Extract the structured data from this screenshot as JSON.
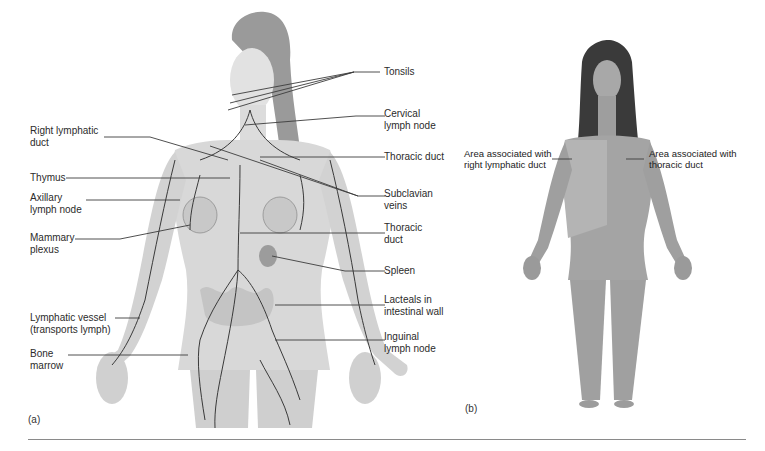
{
  "figure": {
    "panel_a": {
      "tag": "(a)",
      "labels_left": [
        {
          "id": "right-lymphatic-duct",
          "text": "Right lymphatic\nduct"
        },
        {
          "id": "thymus",
          "text": "Thymus"
        },
        {
          "id": "axillary-lymph-node",
          "text": "Axillary\nlymph node"
        },
        {
          "id": "mammary-plexus",
          "text": "Mammary\nplexus"
        },
        {
          "id": "lymphatic-vessel",
          "text": "Lymphatic vessel\n(transports lymph)"
        },
        {
          "id": "bone-marrow",
          "text": "Bone\nmarrow"
        }
      ],
      "labels_right": [
        {
          "id": "tonsils",
          "text": "Tonsils"
        },
        {
          "id": "cervical-lymph-node",
          "text": "Cervical\nlymph node"
        },
        {
          "id": "thoracic-duct-upper",
          "text": "Thoracic duct"
        },
        {
          "id": "subclavian-veins",
          "text": "Subclavian\nveins"
        },
        {
          "id": "thoracic-duct-lower",
          "text": "Thoracic\nduct"
        },
        {
          "id": "spleen",
          "text": "Spleen"
        },
        {
          "id": "lacteals",
          "text": "Lacteals in\nintestinal wall"
        },
        {
          "id": "inguinal-lymph-node",
          "text": "Inguinal\nlymph node"
        }
      ]
    },
    "panel_b": {
      "tag": "(b)",
      "labels": [
        {
          "id": "area-right-lymphatic",
          "text": "Area associated with\nright lymphatic duct"
        },
        {
          "id": "area-thoracic",
          "text": "Area associated with\nthoracic duct"
        }
      ]
    },
    "colors": {
      "skin": "#d9d9d9",
      "skin_shadow": "#bdbdbd",
      "hair_a": "#8e8e8e",
      "hair_b": "#2e2e2e",
      "vessel": "#3a3a3a",
      "leader_line": "#3c3c3c",
      "rule": "#8a8a8a"
    }
  }
}
